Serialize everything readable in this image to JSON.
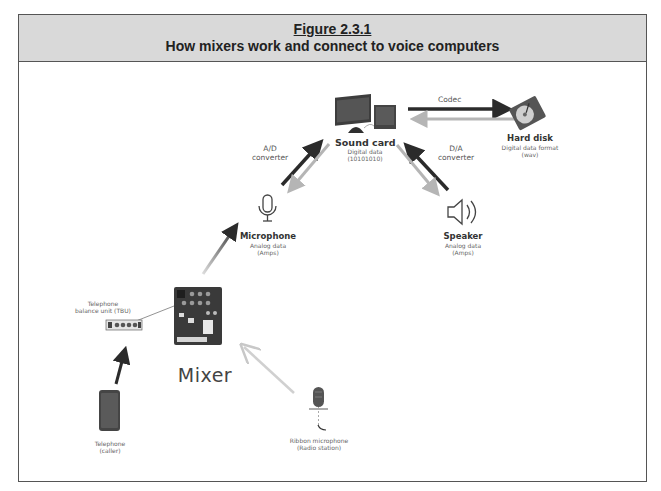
{
  "figure": {
    "number": "Figure 2.3.1",
    "title": "How mixers work and connect to voice computers"
  },
  "nodes": {
    "sound_card": {
      "name": "Sound card",
      "desc_line1": "Digital data",
      "desc_line2": "(10101010)"
    },
    "hard_disk": {
      "name": "Hard disk",
      "desc_line1": "Digital data format",
      "desc_line2": "(wav)"
    },
    "microphone": {
      "name": "Microphone",
      "desc_line1": "Analog data",
      "desc_line2": "(Amps)"
    },
    "speaker": {
      "name": "Speaker",
      "desc_line1": "Analog data",
      "desc_line2": "(Amps)"
    },
    "mixer": {
      "name": "Mixer"
    },
    "tbu": {
      "name_line1": "Telephone",
      "name_line2": "balance unit (TBU)"
    },
    "telephone": {
      "name_line1": "Telephone",
      "name_line2": "(caller)"
    },
    "ribbon_mic": {
      "name_line1": "Ribbon microphone",
      "name_line2": "(Radio station)"
    }
  },
  "edge_labels": {
    "codec": "Codec",
    "ad_line1": "A/D",
    "ad_line2": "converter",
    "da_line1": "D/A",
    "da_line2": "converter"
  },
  "colors": {
    "header_bg": "#d9d9d9",
    "frame_border": "#555555",
    "arrow_dark": "#2b2b2b",
    "arrow_light": "#b5b5b5"
  }
}
